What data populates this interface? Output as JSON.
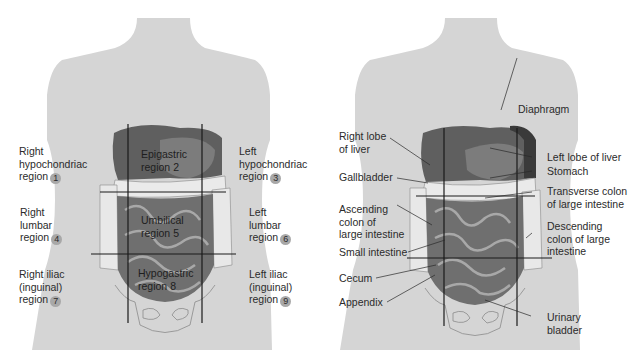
{
  "left_figure": {
    "title": "Abdominopelvic regions",
    "outer_labels": [
      {
        "lines": [
          "Right",
          "hypochondriac",
          "region"
        ],
        "number": "1"
      },
      {
        "lines": [
          "Left",
          "hypochondriac",
          "region"
        ],
        "number": "3"
      },
      {
        "lines": [
          "Right",
          "lumbar",
          "region"
        ],
        "number": "4"
      },
      {
        "lines": [
          "Left",
          "lumbar",
          "region"
        ],
        "number": "6"
      },
      {
        "lines": [
          "Right iliac",
          "(inguinal)",
          "region"
        ],
        "number": "7"
      },
      {
        "lines": [
          "Left iliac",
          "(inguinal)",
          "region"
        ],
        "number": "9"
      }
    ],
    "inner_labels": [
      {
        "lines": [
          "Epigastric",
          "region"
        ],
        "number": "2"
      },
      {
        "lines": [
          "Umbilical",
          "region"
        ],
        "number": "5"
      },
      {
        "lines": [
          "Hypogastric",
          "region"
        ],
        "number": "8"
      }
    ]
  },
  "right_figure": {
    "title": "Organs within regions",
    "labels": {
      "right_lobe_liver": [
        "Right lobe",
        "of liver"
      ],
      "gallbladder": [
        "Gallbladder"
      ],
      "ascending_colon": [
        "Ascending",
        "colon of",
        "large intestine"
      ],
      "small_intestine": [
        "Small intestine"
      ],
      "cecum": [
        "Cecum"
      ],
      "appendix": [
        "Appendix"
      ],
      "diaphragm": [
        "Diaphragm"
      ],
      "left_lobe_liver": [
        "Left lobe of liver"
      ],
      "stomach": [
        "Stomach"
      ],
      "transverse_colon": [
        "Transverse colon",
        "of large intestine"
      ],
      "descending_colon": [
        "Descending",
        "colon of large",
        "intestine"
      ],
      "urinary_bladder": [
        "Urinary",
        "bladder"
      ]
    }
  },
  "colors": {
    "body": "#d4d4d4",
    "organ_dark": "#5e5e5e",
    "organ_mid": "#7a7a7a",
    "organ_light": "#9c9c9c",
    "intestine_fold": "#e8e8e8",
    "grid_line": "#1a1a1a",
    "number_badge": "#a8a8a8"
  }
}
